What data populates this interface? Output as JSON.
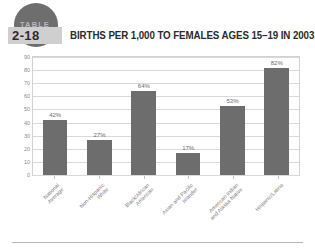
{
  "badge": {
    "kicker": "TABLE",
    "number": "2-18"
  },
  "header": {
    "title": "BIRTHS PER 1,000 TO FEMALES AGES 15–19 IN 2003"
  },
  "colors": {
    "bar": "#6d6d6d",
    "badge_circle": "#6e6e6e",
    "badge_band": "#cfcfcf",
    "gridline": "#d9d9d9",
    "axis_text": "#8a8a8a"
  },
  "chart_data": {
    "type": "bar",
    "title": "BIRTHS PER 1,000 TO FEMALES AGES 15–19 IN 2003",
    "xlabel": "",
    "ylabel": "",
    "ylim": [
      0,
      90
    ],
    "ytick_step": 10,
    "grid": true,
    "legend": "none",
    "categories": [
      "National Average",
      "Non-Hispanic White",
      "Black/African American",
      "Asian and Pacific Islander",
      "American Indian and Alaska Native",
      "Hispanic/Latino"
    ],
    "category_lines": [
      [
        "National",
        "Average"
      ],
      [
        "Non-Hispanic",
        "White"
      ],
      [
        "Black/African",
        "American"
      ],
      [
        "Asian and Pacific",
        "Islander"
      ],
      [
        "American Indian",
        "and Alaska Native"
      ],
      [
        "Hispanic/Latino"
      ]
    ],
    "values": [
      42,
      27,
      64,
      17,
      53,
      82
    ],
    "data_labels": [
      "42%",
      "27%",
      "64%",
      "17%",
      "53%",
      "82%"
    ],
    "yticks": [
      "90",
      "80",
      "70",
      "60",
      "50",
      "40",
      "30",
      "20",
      "10",
      "0"
    ]
  }
}
